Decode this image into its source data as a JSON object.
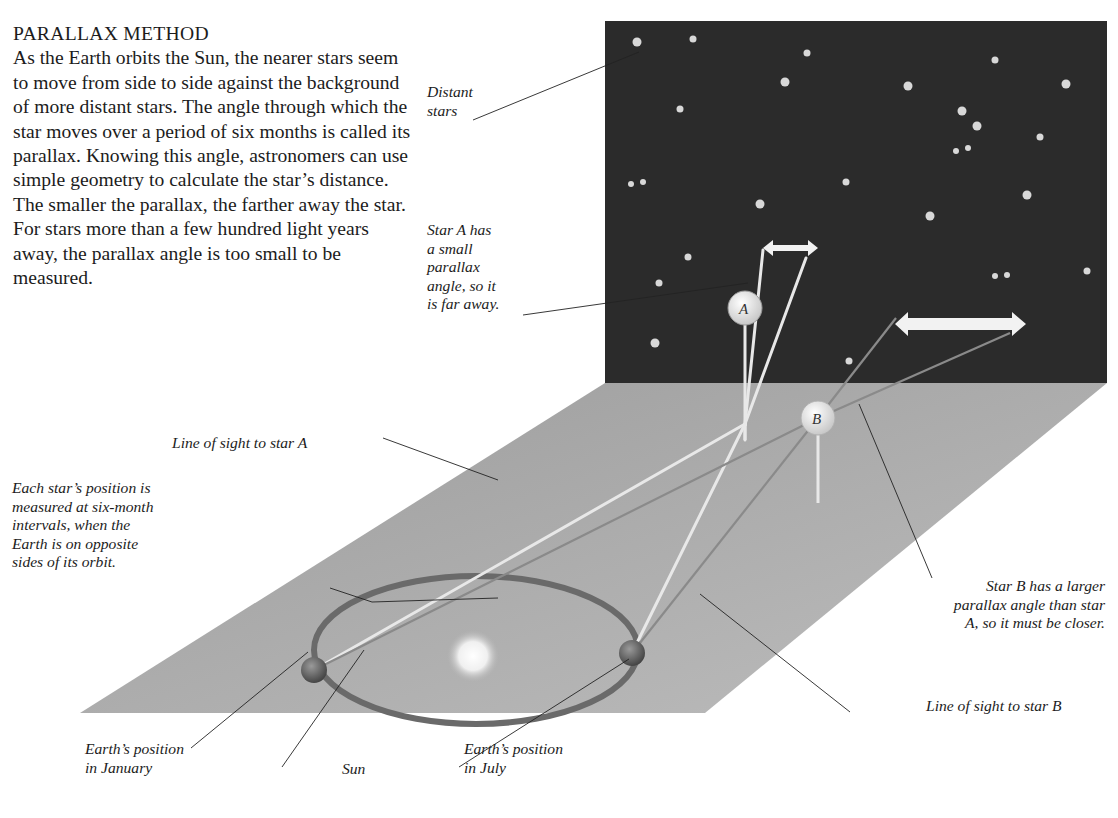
{
  "title": "PARALLAX METHOD",
  "body": "As the Earth orbits the Sun, the nearer stars seem to move from side to side against the background of more distant stars. The angle through which the star moves over a period of six months is called its parallax. Knowing this angle, astronomers can use simple geometry to calculate the star’s distance. The smaller the parallax, the farther away the star. For stars more than a few hundred light years away, the parallax angle is too small to be measured.",
  "labels": {
    "distant_stars": [
      "Distant",
      "stars"
    ],
    "star_a_note": [
      "Star A has",
      "a small",
      "parallax",
      "angle, so it",
      "is far away."
    ],
    "line_of_sight_a": "Line of sight to star A",
    "measurement_note": [
      "Each star’s position is",
      "measured at six-month",
      "intervals, when the",
      "Earth is on opposite",
      "sides of its orbit."
    ],
    "star_b_note": [
      "Star B has a larger",
      "parallax angle than star",
      "A, so it must be closer."
    ],
    "line_of_sight_b": "Line of sight to star B",
    "earth_january": [
      "Earth’s position",
      "in January"
    ],
    "sun": "Sun",
    "earth_july": [
      "Earth’s position",
      "in July"
    ]
  },
  "stars": {
    "a_letter": "A",
    "b_letter": "B"
  },
  "colors": {
    "sky": "#2b2b2b",
    "floor": "#a6a6a6",
    "orbit": "#6a6a6a",
    "sight_line": "#e8e8e8",
    "arrow": "#f2f2f2"
  }
}
